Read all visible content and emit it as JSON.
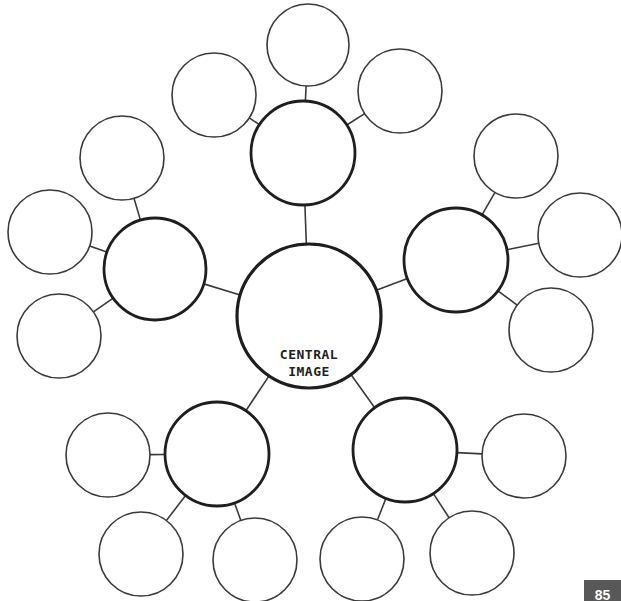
{
  "diagram": {
    "type": "mind-map",
    "central": {
      "label_line1": "CENTRAL",
      "label_line2": "IMAGE",
      "cx": 309,
      "cy": 316,
      "r": 72
    },
    "branches": [
      {
        "name": "top",
        "cx": 303,
        "cy": 153,
        "r": 52,
        "leaves": [
          {
            "cx": 308,
            "cy": 45,
            "r": 41
          },
          {
            "cx": 400,
            "cy": 91,
            "r": 42
          },
          {
            "cx": 214,
            "cy": 95,
            "r": 42
          }
        ]
      },
      {
        "name": "left",
        "cx": 155,
        "cy": 269,
        "r": 51,
        "leaves": [
          {
            "cx": 122,
            "cy": 158,
            "r": 42
          },
          {
            "cx": 50,
            "cy": 232,
            "r": 42
          },
          {
            "cx": 59,
            "cy": 336,
            "r": 42
          }
        ]
      },
      {
        "name": "right",
        "cx": 456,
        "cy": 260,
        "r": 52,
        "leaves": [
          {
            "cx": 516,
            "cy": 156,
            "r": 42
          },
          {
            "cx": 580,
            "cy": 235,
            "r": 42
          },
          {
            "cx": 551,
            "cy": 330,
            "r": 42
          }
        ]
      },
      {
        "name": "bottom-left",
        "cx": 217,
        "cy": 454,
        "r": 52,
        "leaves": [
          {
            "cx": 108,
            "cy": 455,
            "r": 42
          },
          {
            "cx": 141,
            "cy": 554,
            "r": 42
          },
          {
            "cx": 255,
            "cy": 560,
            "r": 42
          }
        ]
      },
      {
        "name": "bottom-right",
        "cx": 405,
        "cy": 450,
        "r": 52,
        "leaves": [
          {
            "cx": 524,
            "cy": 456,
            "r": 42
          },
          {
            "cx": 362,
            "cy": 559,
            "r": 42
          },
          {
            "cx": 472,
            "cy": 553,
            "r": 42
          }
        ]
      }
    ],
    "colors": {
      "stroke_main": "#1e1e1e",
      "stroke_leaf": "#3a3a3a",
      "line": "#3a3a3a"
    }
  },
  "page": {
    "number": "85",
    "number_bg": "#585858"
  }
}
